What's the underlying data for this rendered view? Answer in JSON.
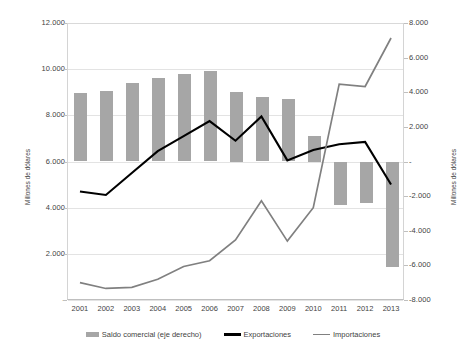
{
  "chart_data": {
    "type": "bar",
    "title": "",
    "subtitle": "",
    "xlabel": "",
    "ylabel": "Millones de dólares",
    "ylabel_right": "Millones de dólares",
    "categories": [
      "2001",
      "2002",
      "2003",
      "2004",
      "2005",
      "2006",
      "2007",
      "2008",
      "2009",
      "2010",
      "2011",
      "2012",
      "2013"
    ],
    "ylim": [
      0,
      12000
    ],
    "ylim_right": [
      -8000,
      8000
    ],
    "ytick_labels": [
      "12.000",
      "10.000",
      "8.000",
      "6.000",
      "4.000",
      "2.000",
      "-"
    ],
    "ytick_values": [
      12000,
      10000,
      8000,
      6000,
      4000,
      2000,
      0
    ],
    "ytick_labels_right": [
      "8.000",
      "6.000",
      "4.000",
      "2.000",
      "-",
      "-2.000",
      "-4.000",
      "-6.000",
      "-8.000"
    ],
    "ytick_values_right": [
      8000,
      6000,
      4000,
      2000,
      0,
      -2000,
      -4000,
      -6000,
      -8000
    ],
    "grid": true,
    "legend_position": "bottom",
    "series": [
      {
        "name": "Saldo comercial (eje derecho)",
        "type": "bar",
        "axis": "right",
        "color": "#a6a6a6",
        "values": [
          3950,
          4050,
          4550,
          4800,
          5050,
          5200,
          4000,
          3700,
          3600,
          1500,
          -2500,
          -2400,
          -6100
        ]
      },
      {
        "name": "Exportaciones",
        "type": "line",
        "axis": "left",
        "color": "#000000",
        "values": [
          4700,
          4550,
          5500,
          6450,
          7100,
          7750,
          6900,
          7950,
          6050,
          6500,
          6750,
          6850,
          5000
        ]
      },
      {
        "name": "Importaciones",
        "type": "line",
        "axis": "left",
        "color": "#808080",
        "values": [
          750,
          500,
          550,
          900,
          1450,
          1700,
          2600,
          4300,
          2550,
          4000,
          9350,
          9250,
          11350
        ]
      }
    ]
  },
  "legend": {
    "items": [
      {
        "label": "Saldo comercial (eje derecho)",
        "kind": "bar",
        "color": "#a6a6a6"
      },
      {
        "label": "Exportaciones",
        "kind": "line",
        "color": "#000000"
      },
      {
        "label": "Importaciones",
        "kind": "line",
        "color": "#808080"
      }
    ]
  }
}
